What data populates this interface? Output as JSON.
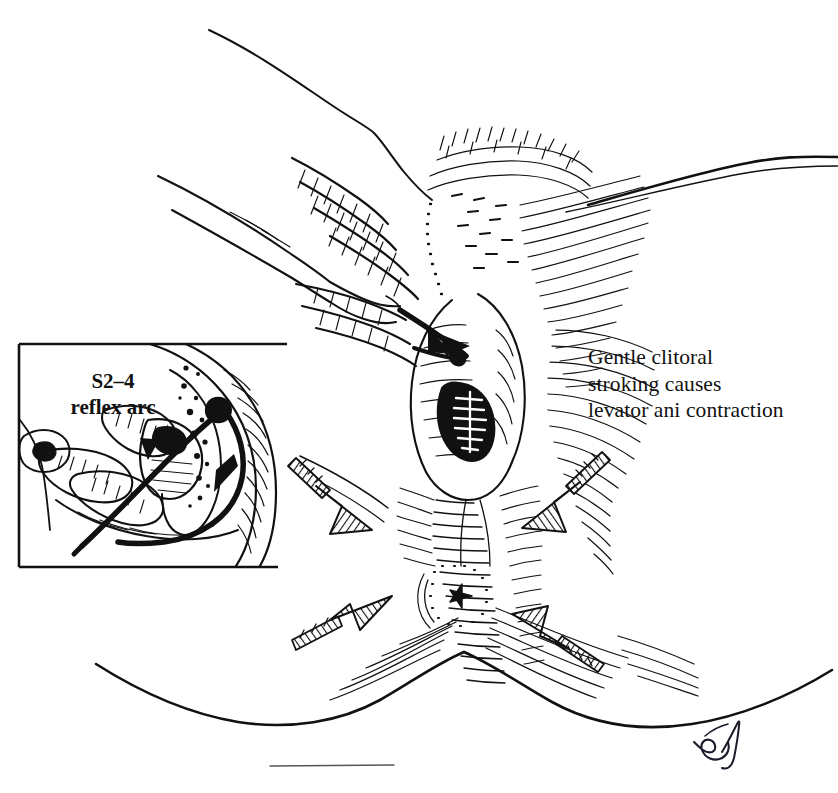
{
  "figure": {
    "domain": "medical-illustration",
    "medium": "pen-and-ink line drawing",
    "background_color": "#ffffff",
    "ink_color": "#111111",
    "width": 838,
    "height": 793
  },
  "caption": {
    "lines": [
      "Gentle clitoral",
      "stroking causes",
      "levator ani contraction"
    ]
  },
  "inset": {
    "label_lines": [
      "S2–4",
      "reflex arc"
    ],
    "border": {
      "left": 19,
      "top": 344,
      "right": 287,
      "bottom": 567
    },
    "description": "Sagittal inset showing the examiner's fingers and a bold double-headed curved arrow tracing the S2–4 reflex pathway"
  },
  "annotations": {
    "arrows": [
      {
        "name": "arrow-upper-left",
        "direction": "down-right",
        "style": "hatched-solid"
      },
      {
        "name": "arrow-upper-right",
        "direction": "down-left",
        "style": "hatched-solid"
      },
      {
        "name": "arrow-lower-left",
        "direction": "up-right",
        "style": "hatched-solid"
      },
      {
        "name": "arrow-lower-right",
        "direction": "up-left",
        "style": "hatched-solid"
      }
    ],
    "arrow_meaning": "Converging arrows indicate the direction of levator ani muscle contraction"
  },
  "signature": {
    "text": "artist signature",
    "position": "bottom-right"
  },
  "structures": [
    {
      "name": "examiner-hand",
      "label": ""
    },
    {
      "name": "clitoral-region",
      "label": ""
    },
    {
      "name": "vaginal-introitus",
      "label": ""
    },
    {
      "name": "perineal-body",
      "label": ""
    },
    {
      "name": "anus",
      "label": ""
    },
    {
      "name": "labia",
      "label": ""
    }
  ]
}
